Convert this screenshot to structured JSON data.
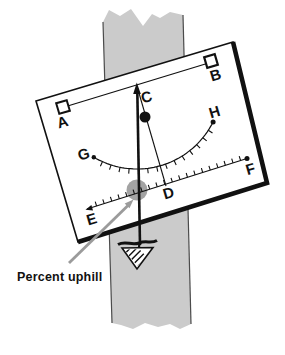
{
  "diagram": {
    "point_labels": [
      "A",
      "B",
      "C",
      "D",
      "E",
      "F",
      "G",
      "H"
    ],
    "caption": "Percent uphill",
    "colors": {
      "stake_gray": "#cbcbcb",
      "stake_edge": "#4b4b4b",
      "marker_gray": "#a3a3a3",
      "pointer_gray": "#9b9b9b",
      "ink": "#111111",
      "paper": "#ffffff"
    }
  }
}
